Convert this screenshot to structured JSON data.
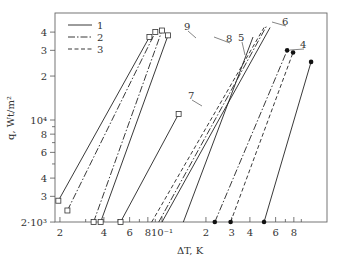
{
  "chart_data": {
    "type": "line",
    "title": "",
    "xlabel": "ΔT, K",
    "ylabel": "q, Wt/m²",
    "xscale": "log",
    "yscale": "log",
    "xlim": [
      0.019,
      1.05
    ],
    "ylim": [
      2000,
      45000
    ],
    "x_ticks": [
      "2",
      "4",
      "6",
      "8",
      "10⁻¹",
      "2",
      "3",
      "4",
      "6",
      "8"
    ],
    "y_ticks": [
      "2·10³",
      "3",
      "4",
      "6",
      "8",
      "10⁴",
      "2",
      "3",
      "4"
    ],
    "legend": [
      {
        "label": "1",
        "style": "solid"
      },
      {
        "label": "2",
        "style": "dash-dot"
      },
      {
        "label": "3",
        "style": "dashed"
      }
    ],
    "annotations": [
      "4",
      "5",
      "6",
      "7",
      "8",
      "9"
    ],
    "series": [
      {
        "name": "9 (1)",
        "style": "solid",
        "marker": "open-square",
        "points": [
          [
            0.0195,
            2800
          ],
          [
            0.082,
            37000
          ]
        ]
      },
      {
        "name": "9 (2)",
        "style": "dash-dot",
        "marker": "open-square",
        "points": [
          [
            0.0225,
            2400
          ],
          [
            0.09,
            40000
          ]
        ]
      },
      {
        "name": "8 (2)",
        "style": "dash-dot",
        "marker": "open-square",
        "points": [
          [
            0.034,
            2000
          ],
          [
            0.1,
            41000
          ]
        ]
      },
      {
        "name": "8 (1)",
        "style": "solid",
        "marker": "open-square",
        "points": [
          [
            0.038,
            2000
          ],
          [
            0.11,
            38000
          ]
        ]
      },
      {
        "name": "7 (1)",
        "style": "solid",
        "marker": "open-square",
        "points": [
          [
            0.052,
            2000
          ],
          [
            0.13,
            11000
          ]
        ]
      },
      {
        "name": "5/6 (3)",
        "style": "dashed",
        "points": [
          [
            0.085,
            2000
          ],
          [
            0.5,
            43000
          ]
        ]
      },
      {
        "name": "5/6 (2)",
        "style": "dash-dot",
        "points": [
          [
            0.095,
            2000
          ],
          [
            0.52,
            44000
          ]
        ]
      },
      {
        "name": "5/6 (1)",
        "style": "solid",
        "points": [
          [
            0.1,
            2000
          ],
          [
            0.55,
            43000
          ]
        ]
      },
      {
        "name": "5 (1)",
        "style": "solid",
        "points": [
          [
            0.14,
            2000
          ],
          [
            0.42,
            37000
          ]
        ]
      },
      {
        "name": "4 (2)",
        "style": "dash-dot",
        "marker": "filled-circle",
        "points": [
          [
            0.23,
            2000
          ],
          [
            0.72,
            30000
          ]
        ]
      },
      {
        "name": "4 (3)",
        "style": "dashed",
        "marker": "filled-circle",
        "points": [
          [
            0.295,
            2000
          ],
          [
            0.79,
            29000
          ]
        ]
      },
      {
        "name": "4 (1)",
        "style": "solid",
        "marker": "filled-circle",
        "points": [
          [
            0.5,
            2000
          ],
          [
            1.05,
            25000
          ]
        ]
      }
    ]
  }
}
